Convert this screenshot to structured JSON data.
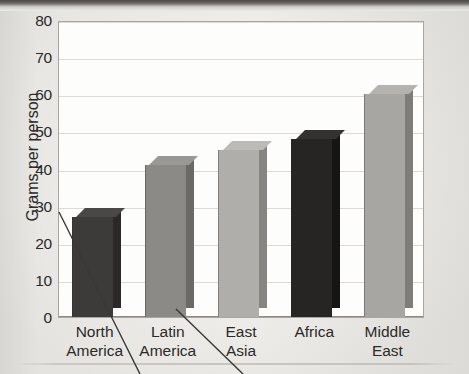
{
  "chart_data": {
    "type": "bar",
    "title": "",
    "subtitle": "",
    "xlabel": "",
    "ylabel": "Grams per person",
    "ylim": [
      0,
      80
    ],
    "yticks": [
      80,
      70,
      60,
      50,
      40,
      30,
      20,
      10,
      0
    ],
    "grid": true,
    "legend": null,
    "legend_position": "none",
    "categories": [
      "North\nAmerica",
      "Latin\nAmerica",
      "East\nAsia",
      "Africa",
      "Middle\nEast"
    ],
    "category_lines": [
      [
        "North",
        "America"
      ],
      [
        "Latin",
        "America"
      ],
      [
        "East",
        "Asia"
      ],
      [
        "Africa"
      ],
      [
        "Middle",
        "East"
      ]
    ],
    "values": [
      27,
      41,
      45,
      48,
      60
    ],
    "bar_colors": [
      "#3d3b39",
      "#8c8a86",
      "#b0aeaa",
      "#262523",
      "#a8a6a2"
    ],
    "bar_side_colors": [
      "#2a2927",
      "#6b6966",
      "#878581",
      "#161514",
      "#7f7d79"
    ],
    "bar_top_colors": [
      "#4a4846",
      "#9a9894",
      "#bdbbb7",
      "#333230",
      "#b5b3af"
    ],
    "style": "3d-bars-grayscale-scan"
  },
  "axis": {
    "y_title": "Grams per person",
    "tick_labels": [
      "80",
      "70",
      "60",
      "50",
      "40",
      "30",
      "20",
      "10",
      "0"
    ]
  },
  "annotations": {
    "leader_lines": [
      {
        "name": "leader-line-left",
        "from": "y-axis-title",
        "to": "page-bottom-left"
      },
      {
        "name": "leader-line-center",
        "from": "latin-america-bar",
        "to": "page-bottom-center"
      }
    ]
  },
  "colors": {
    "page_background": "#f1efeb",
    "plot_background": "#fdfdfc",
    "plot_border": "#a9a6a1",
    "gridline": "#dddad5",
    "text": "#2b2a28",
    "scan_band": "#4a4845"
  }
}
